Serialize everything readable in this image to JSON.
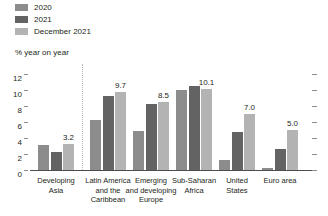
{
  "legend": {
    "items": [
      {
        "label": "2020",
        "color": "#8c8c8c"
      },
      {
        "label": "2021",
        "color": "#636363"
      },
      {
        "label": "December 2021",
        "color": "#b3b3b3"
      }
    ]
  },
  "axis_title": "% year on year",
  "chart_data": {
    "type": "bar",
    "title": "",
    "subtitle": "",
    "xlabel": "",
    "ylabel": "% year on year",
    "ylim": [
      0,
      12
    ],
    "yticks": [
      0,
      2,
      4,
      6,
      8,
      10,
      12
    ],
    "grid": false,
    "legend_position": "top-left",
    "categories": [
      "Developing Asia",
      "Latin America and the Caribbean",
      "Emerging and developing Europe",
      "Sub-Saharan Africa",
      "United States",
      "Euro area"
    ],
    "category_lines": [
      [
        "Developing",
        "Asia"
      ],
      [
        "Latin America",
        "and the",
        "Caribbean"
      ],
      [
        "Emerging",
        "and developing",
        "Europe"
      ],
      [
        "Sub-Saharan",
        "Africa"
      ],
      [
        "United",
        "States"
      ],
      [
        "Euro area"
      ]
    ],
    "series": [
      {
        "name": "2020",
        "color": "#8c8c8c",
        "values": [
          3.1,
          6.2,
          4.9,
          10.0,
          1.2,
          0.3
        ]
      },
      {
        "name": "2021",
        "color": "#636363",
        "values": [
          2.2,
          9.3,
          8.3,
          10.5,
          4.7,
          2.6
        ]
      },
      {
        "name": "December 2021",
        "color": "#b3b3b3",
        "values": [
          3.2,
          9.7,
          8.5,
          10.1,
          7.0,
          5.0
        ]
      }
    ],
    "value_labels": [
      {
        "category": "Developing Asia",
        "series": "December 2021",
        "text": "3.2"
      },
      {
        "category": "Latin America and the Caribbean",
        "series": "December 2021",
        "text": "9.7"
      },
      {
        "category": "Emerging and developing Europe",
        "series": "December 2021",
        "text": "8.5"
      },
      {
        "category": "Sub-Saharan Africa",
        "series": "December 2021",
        "text": "10.1"
      },
      {
        "category": "United States",
        "series": "December 2021",
        "text": "7.0"
      },
      {
        "category": "Euro area",
        "series": "December 2021",
        "text": "5.0"
      }
    ],
    "divider_after_category_index": 0
  }
}
